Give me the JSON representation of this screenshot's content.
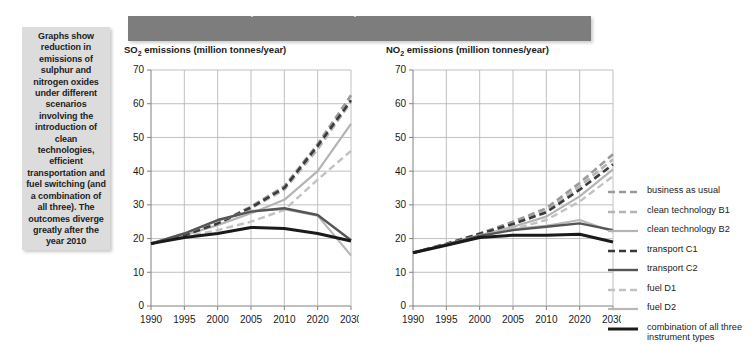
{
  "sidebar": {
    "caption": "Graphs show reduction in emissions of sulphur and nitrogen oxides under different scenarios involving the introduction of clean technologies, efficient transportation and fuel switching (and a combination of all three). The outcomes diverge greatly after the year 2010"
  },
  "header": {
    "title": "Sulphur and nitrogen dioxide emissions, continental Asia, different scenarios",
    "bar_color": "#7d7d7d",
    "text_color": "#ffffff"
  },
  "legend": {
    "position": "right",
    "entries": [
      {
        "label": "business as usual",
        "color": "#9a9a9a",
        "dash": "7,4",
        "width": 2.6
      },
      {
        "label": "clean technology B1",
        "color": "#b4b4b4",
        "dash": "7,4",
        "width": 2.6
      },
      {
        "label": "clean technology B2",
        "color": "#b4b4b4",
        "dash": "none",
        "width": 2.2
      },
      {
        "label": "transport C1",
        "color": "#3a3a3a",
        "dash": "7,4",
        "width": 2.6
      },
      {
        "label": "transport C2",
        "color": "#555555",
        "dash": "none",
        "width": 2.4
      },
      {
        "label": "fuel D1",
        "color": "#c2c2c2",
        "dash": "7,4",
        "width": 2.4
      },
      {
        "label": "fuel D2",
        "color": "#b8b8b8",
        "dash": "none",
        "width": 2.2
      },
      {
        "label": "combination of all three instrument types",
        "color": "#1a1a1a",
        "dash": "none",
        "width": 3.0
      }
    ]
  },
  "chart_data": [
    {
      "type": "line",
      "id": "so2",
      "title": "SO2 emissions (million tonnes/year)",
      "title_html": "SO<sub>2</sub> emissions (million tonnes/year)",
      "xlabel": "",
      "ylabel": "million tonnes/year",
      "x": [
        1990,
        1995,
        2000,
        2005,
        2010,
        2020,
        2030
      ],
      "xticklabels": [
        "1990",
        "1995",
        "2000",
        "2005",
        "2010",
        "2020",
        "2030"
      ],
      "ylim": [
        0,
        70
      ],
      "yticks": [
        0,
        10,
        20,
        30,
        40,
        50,
        60,
        70
      ],
      "grid": true,
      "series": [
        {
          "name": "business as usual",
          "values": [
            18.5,
            21.0,
            24.5,
            29.5,
            35.5,
            48.0,
            62.5
          ]
        },
        {
          "name": "clean technology B1",
          "values": [
            18.5,
            21.0,
            24.3,
            29.0,
            34.5,
            46.5,
            60.5
          ]
        },
        {
          "name": "clean technology B2",
          "values": [
            18.5,
            21.0,
            24.0,
            27.5,
            31.5,
            40.0,
            54.0
          ]
        },
        {
          "name": "transport C1",
          "values": [
            18.5,
            21.0,
            24.5,
            29.2,
            35.0,
            47.5,
            61.0
          ]
        },
        {
          "name": "transport C2",
          "values": [
            18.5,
            21.5,
            25.5,
            28.0,
            29.0,
            27.0,
            19.5
          ]
        },
        {
          "name": "fuel D1",
          "values": [
            18.5,
            20.5,
            22.5,
            25.0,
            28.5,
            37.5,
            46.0
          ]
        },
        {
          "name": "fuel D2",
          "values": [
            18.5,
            21.5,
            25.3,
            28.2,
            28.7,
            26.8,
            15.0
          ]
        },
        {
          "name": "combination of all three instrument types",
          "values": [
            18.5,
            20.3,
            21.5,
            23.3,
            23.0,
            21.5,
            19.3
          ]
        }
      ]
    },
    {
      "type": "line",
      "id": "no2",
      "title": "NO2 emissions (million tonnes/year)",
      "title_html": "NO<sub>2</sub> emissions (million tonnes/year)",
      "xlabel": "",
      "ylabel": "million tonnes/year",
      "x": [
        1990,
        1995,
        2000,
        2005,
        2010,
        2020,
        2030
      ],
      "xticklabels": [
        "1990",
        "1995",
        "2000",
        "2005",
        "2010",
        "2020",
        "2030"
      ],
      "ylim": [
        0,
        70
      ],
      "yticks": [
        0,
        10,
        20,
        30,
        40,
        50,
        60,
        70
      ],
      "grid": true,
      "series": [
        {
          "name": "business as usual",
          "values": [
            15.8,
            18.5,
            21.5,
            25.0,
            29.0,
            36.5,
            45.0
          ]
        },
        {
          "name": "clean technology B1",
          "values": [
            15.8,
            18.4,
            21.3,
            24.5,
            28.2,
            35.5,
            43.5
          ]
        },
        {
          "name": "clean technology B2",
          "values": [
            15.8,
            18.3,
            21.0,
            23.5,
            26.5,
            32.5,
            40.5
          ]
        },
        {
          "name": "transport C1",
          "values": [
            15.8,
            18.4,
            21.4,
            24.3,
            27.8,
            34.5,
            42.0
          ]
        },
        {
          "name": "transport C2",
          "values": [
            15.8,
            18.2,
            20.8,
            22.5,
            23.5,
            24.5,
            22.5
          ]
        },
        {
          "name": "fuel D1",
          "values": [
            15.8,
            18.0,
            20.5,
            22.8,
            25.5,
            31.0,
            38.5
          ]
        },
        {
          "name": "fuel D2",
          "values": [
            15.8,
            18.3,
            21.0,
            22.8,
            23.8,
            25.5,
            22.0
          ]
        },
        {
          "name": "combination of all three instrument types",
          "values": [
            15.8,
            18.0,
            20.3,
            21.0,
            21.0,
            21.3,
            19.0
          ]
        }
      ]
    }
  ]
}
